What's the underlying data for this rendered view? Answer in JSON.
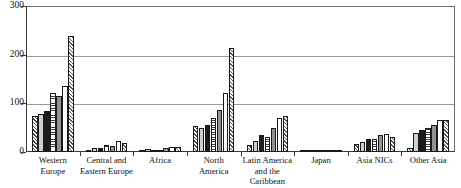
{
  "chart_data": {
    "type": "bar",
    "title": "",
    "subtitle": "",
    "xlabel": "",
    "ylabel": "",
    "ylim": [
      0,
      300
    ],
    "yticks": [
      0,
      100,
      200,
      300
    ],
    "ytick_labels": [
      "0",
      "100",
      "200",
      "300"
    ],
    "grid": true,
    "grid_axis": "y",
    "legend": false,
    "legend_position": "none",
    "orientation": "vertical",
    "categories": [
      "Western\nEurope",
      "Central and\nEastern Europe",
      "Africa",
      "North\nAmerica",
      "Latin America\nand the\nCaribbean",
      "Japan",
      "Asia NICs",
      "Other Asia"
    ],
    "series": [
      {
        "name": "series-1",
        "pattern": "diagonal-hatch",
        "values": [
          73,
          4,
          5,
          53,
          15,
          1,
          16,
          9
        ]
      },
      {
        "name": "series-2",
        "pattern": "light-gray",
        "values": [
          78,
          8,
          6,
          50,
          22,
          1,
          21,
          40
        ]
      },
      {
        "name": "series-3",
        "pattern": "black",
        "values": [
          85,
          9,
          5,
          55,
          34,
          5,
          26,
          45
        ]
      },
      {
        "name": "series-4",
        "pattern": "horizontal-lines",
        "values": [
          122,
          15,
          4,
          70,
          30,
          5,
          26,
          49
        ]
      },
      {
        "name": "series-5",
        "pattern": "medium-gray",
        "values": [
          116,
          12,
          9,
          86,
          50,
          1,
          35,
          56
        ]
      },
      {
        "name": "series-6",
        "pattern": "white",
        "values": [
          135,
          22,
          10,
          122,
          70,
          1,
          38,
          65
        ]
      },
      {
        "name": "series-7",
        "pattern": "diagonal-hatch",
        "values": [
          239,
          19,
          10,
          213,
          75,
          1,
          30,
          65
        ]
      }
    ]
  },
  "colors": {
    "axis": "#3a3a3a",
    "gridline": "#9a9a9a",
    "bar_outline": "#1a1a1a",
    "light_gray": "#cfcfcf",
    "medium_gray": "#939393",
    "black": "#1c1c1c",
    "white": "#ffffff",
    "background": "#ffffff"
  }
}
